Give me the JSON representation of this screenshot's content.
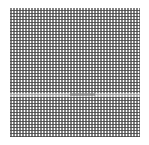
{
  "image": {
    "description": "Dense halftone-like grid of small gray squares on white background",
    "pattern": "grid",
    "cell_pitch_px": 3,
    "colors": {
      "background": "#ffffff",
      "cell": "#5a5a5a"
    }
  }
}
